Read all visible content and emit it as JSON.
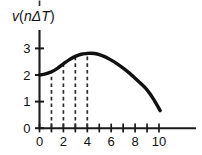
{
  "figure": {
    "background_color": "#ffffff",
    "ink_color": "#111111",
    "width": 202,
    "height": 155
  },
  "axes": {
    "y_axis_title_parts": {
      "v": "v",
      "open_paren": "(",
      "n": "n",
      "delta_t": "ΔT",
      "close_paren": ")"
    },
    "y_axis_title": "v(nΔT)",
    "x_axis_title": ""
  },
  "chart_data": {
    "type": "line",
    "title": "",
    "xlabel": "",
    "ylabel": "v(nΔT)",
    "xlim": [
      0,
      13
    ],
    "ylim": [
      0,
      3.4
    ],
    "grid": false,
    "legend": null,
    "x_ticks": [
      0,
      1,
      2,
      3,
      4,
      5,
      6,
      7,
      8,
      9,
      10
    ],
    "x_tick_labels": [
      "0",
      "",
      "2",
      "",
      "4",
      "",
      "6",
      "",
      "8",
      "",
      "10"
    ],
    "x_labeled_ticks": [
      {
        "value": 0,
        "label": "0"
      },
      {
        "value": 2,
        "label": "2"
      },
      {
        "value": 4,
        "label": "4"
      },
      {
        "value": 6,
        "label": "6"
      },
      {
        "value": 8,
        "label": "8"
      },
      {
        "value": 10,
        "label": "10"
      }
    ],
    "y_ticks": [
      0,
      1,
      2,
      3
    ],
    "y_tick_labels": [
      "0",
      "1",
      "2",
      "3"
    ],
    "series": [
      {
        "name": "v(nΔT)",
        "style": "thick-solid-curve",
        "x": [
          0.0,
          0.5,
          1.0,
          1.5,
          2.0,
          2.5,
          3.0,
          3.5,
          4.0,
          4.3,
          4.6,
          5.0,
          5.5,
          6.0,
          6.5,
          7.0,
          7.5,
          8.0,
          8.5,
          9.0,
          9.5,
          10.1
        ],
        "values": [
          2.0,
          2.04,
          2.12,
          2.25,
          2.42,
          2.58,
          2.7,
          2.78,
          2.81,
          2.82,
          2.81,
          2.77,
          2.68,
          2.56,
          2.42,
          2.26,
          2.08,
          1.88,
          1.67,
          1.44,
          1.12,
          0.66
        ]
      }
    ],
    "annotations": {
      "drop_lines": [
        {
          "x": 1,
          "y_top": 2.12,
          "style": "dashed",
          "label": ""
        },
        {
          "x": 2,
          "y_top": 2.42,
          "style": "dashed",
          "label": ""
        },
        {
          "x": 3,
          "y_top": 2.7,
          "style": "dashed",
          "label": ""
        },
        {
          "x": 4,
          "y_top": 2.81,
          "style": "dashed",
          "label": ""
        }
      ]
    }
  }
}
